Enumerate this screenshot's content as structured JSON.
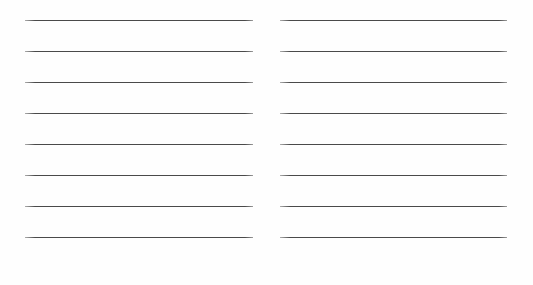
{
  "page": {
    "kind": "ruled-writing-sheet",
    "width": 533,
    "height": 285,
    "background_color": "#ffffff",
    "content_text": "",
    "note": "blank two-column ruled sheet, no written content"
  },
  "rules": {
    "color": "#4a4a4a",
    "thickness_px": 1,
    "line_spacing_px": 31,
    "lines_per_column": 8,
    "first_line_y": 20
  },
  "columns": [
    {
      "name": "left",
      "left_px": 25,
      "right_px": 253,
      "width_px": 228,
      "lines": [
        {
          "index": 1,
          "y": 20,
          "text": ""
        },
        {
          "index": 2,
          "y": 51,
          "text": ""
        },
        {
          "index": 3,
          "y": 82,
          "text": ""
        },
        {
          "index": 4,
          "y": 113,
          "text": ""
        },
        {
          "index": 5,
          "y": 144,
          "text": ""
        },
        {
          "index": 6,
          "y": 175,
          "text": ""
        },
        {
          "index": 7,
          "y": 206,
          "text": ""
        },
        {
          "index": 8,
          "y": 237,
          "text": ""
        }
      ]
    },
    {
      "name": "right",
      "left_px": 280,
      "right_px": 507,
      "width_px": 227,
      "lines": [
        {
          "index": 1,
          "y": 20,
          "text": ""
        },
        {
          "index": 2,
          "y": 51,
          "text": ""
        },
        {
          "index": 3,
          "y": 82,
          "text": ""
        },
        {
          "index": 4,
          "y": 113,
          "text": ""
        },
        {
          "index": 5,
          "y": 144,
          "text": ""
        },
        {
          "index": 6,
          "y": 175,
          "text": ""
        },
        {
          "index": 7,
          "y": 206,
          "text": ""
        },
        {
          "index": 8,
          "y": 237,
          "text": ""
        }
      ]
    }
  ]
}
